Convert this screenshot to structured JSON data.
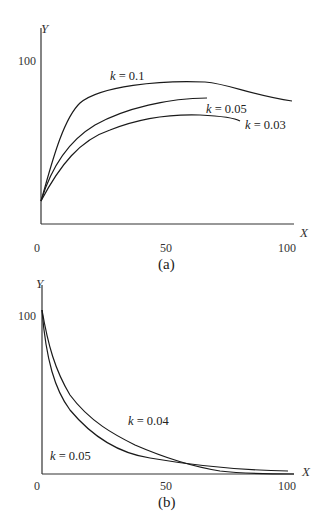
{
  "chart_data": [
    {
      "type": "line",
      "caption": "(a)",
      "xlabel": "X",
      "ylabel": "Y",
      "x_ticks": [
        "0",
        "50",
        "100"
      ],
      "y_ticks": [
        "100"
      ],
      "xlim": [
        0,
        100
      ],
      "ylim": [
        0,
        100
      ],
      "grid": false,
      "legend": "inline labels",
      "series": [
        {
          "name": "k = 0.1",
          "x": [
            0,
            5,
            10,
            15,
            20,
            30,
            40,
            50,
            60,
            70,
            80,
            90,
            100
          ],
          "y": [
            14,
            44,
            60,
            69,
            73,
            77,
            78.5,
            79,
            79,
            78,
            74,
            70,
            66
          ]
        },
        {
          "name": "k = 0.05",
          "x": [
            0,
            5,
            10,
            20,
            30,
            40,
            50,
            60,
            67
          ],
          "y": [
            14,
            32,
            44,
            57,
            63,
            67,
            69,
            70,
            70
          ]
        },
        {
          "name": "k = 0.03",
          "x": [
            0,
            10,
            20,
            30,
            40,
            50,
            60,
            70,
            80
          ],
          "y": [
            14,
            33,
            45,
            52,
            56,
            58.5,
            59.5,
            59.5,
            58
          ]
        }
      ],
      "annotations": [
        {
          "text": "k = 0.1",
          "x": 30,
          "y": 83
        },
        {
          "text": "k = 0.05",
          "x": 67,
          "y": 64
        },
        {
          "text": "k = 0.03",
          "x": 83,
          "y": 57
        }
      ]
    },
    {
      "type": "line",
      "caption": "(b)",
      "xlabel": "X",
      "ylabel": "Y",
      "x_ticks": [
        "0",
        "50",
        "100"
      ],
      "y_ticks": [
        "100"
      ],
      "xlim": [
        0,
        100
      ],
      "ylim": [
        0,
        100
      ],
      "grid": false,
      "legend": "inline labels",
      "series": [
        {
          "name": "k = 0.04",
          "x": [
            0,
            5,
            10,
            20,
            30,
            40,
            50,
            60,
            70,
            80,
            90,
            100
          ],
          "y": [
            100,
            75,
            58,
            40,
            28,
            19,
            11,
            6,
            2.5,
            1,
            0.5,
            0.3
          ]
        },
        {
          "name": "k = 0.05",
          "x": [
            0,
            3,
            6,
            10,
            15,
            20,
            30,
            40,
            50,
            60,
            70,
            80,
            90,
            100
          ],
          "y": [
            100,
            72,
            52,
            36,
            23,
            16,
            9,
            6,
            4.5,
            3.5,
            3,
            2.5,
            2.2,
            2
          ]
        }
      ],
      "annotations": [
        {
          "text": "k = 0.04",
          "x": 40,
          "y": 31
        },
        {
          "text": "k = 0.05",
          "x": 10,
          "y": 10
        }
      ]
    }
  ]
}
